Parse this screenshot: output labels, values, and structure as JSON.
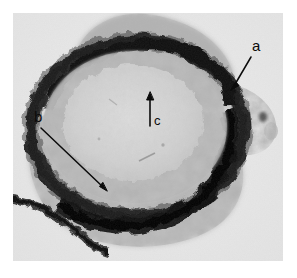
{
  "figure": {
    "kind": "light-micrograph",
    "colorspace": "grayscale",
    "background_color": "#ffffff",
    "field_background_color": "#e9e9e9",
    "stain_dark_color": "#0d0d0d",
    "tissue_mid_color": "#9a9a9a",
    "lumen_color": "#d4d4d4",
    "annotation_color": "#0b0b0b"
  },
  "annotations": [
    {
      "id": "a",
      "label": "a",
      "label_x": 252,
      "label_y": 38,
      "arrow_tail_x": 251,
      "arrow_tail_y": 57,
      "arrow_tip_x": 231,
      "arrow_tip_y": 90,
      "points_to": "dark stained outer epithelial ring, upper right"
    },
    {
      "id": "b",
      "label": "b",
      "label_x": 34,
      "label_y": 109,
      "arrow_tail_x": 41,
      "arrow_tail_y": 128,
      "arrow_tip_x": 107,
      "arrow_tip_y": 191,
      "points_to": "vacuolated tissue layer inside the ring, lower left"
    },
    {
      "id": "c",
      "label": "c",
      "label_x": 154,
      "label_y": 114,
      "arrow_tail_x": 150,
      "arrow_tail_y": 126,
      "arrow_tip_x": 150,
      "arrow_tip_y": 93,
      "points_to": "pale central lumen / core region"
    }
  ],
  "micrograph_geometry": {
    "frame_left": 13,
    "frame_top": 13,
    "frame_width": 270,
    "frame_height": 248,
    "ring_center_x": 128,
    "ring_center_y": 118,
    "ring_radius_x": 112,
    "ring_radius_y": 96,
    "lumen_center_x": 122,
    "lumen_center_y": 113,
    "lumen_radius_x": 72,
    "lumen_radius_y": 60
  }
}
